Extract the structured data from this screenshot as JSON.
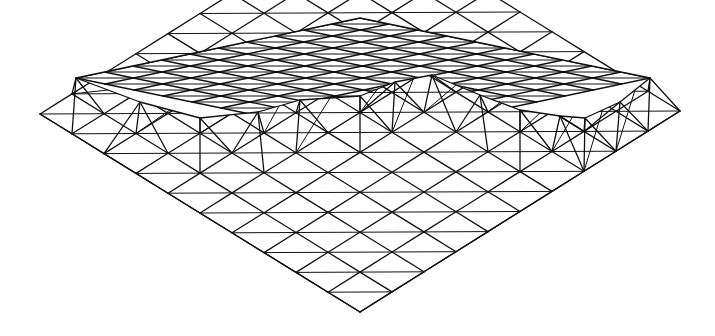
{
  "figure": {
    "title": "Space frame wireframe drawing",
    "stroke_color": "#111111",
    "background": "#ffffff"
  },
  "geometry": {
    "lower_layer": {
      "corners": {
        "left": [
          40,
          114
        ],
        "bottom": [
          360,
          312
        ],
        "right": [
          680,
          111
        ],
        "back": [
          360,
          -87
        ]
      },
      "divisions": 10
    },
    "upper_layer": {
      "corners": {
        "top": [
          360,
          18
        ],
        "left": [
          76,
          78
        ],
        "right": [
          650,
          78
        ],
        "front": [
          366,
          138
        ]
      },
      "divisions": 10,
      "visible_rows_from_back": 4
    },
    "recess_front_edge": [
      [
        76,
        78
      ],
      [
        140,
        102
      ],
      [
        200,
        118
      ],
      [
        258,
        112
      ],
      [
        300,
        100
      ],
      [
        360,
        96
      ],
      [
        395,
        82
      ],
      [
        432,
        75
      ],
      [
        480,
        95
      ],
      [
        520,
        110
      ],
      [
        560,
        116
      ],
      [
        585,
        118
      ],
      [
        620,
        102
      ],
      [
        650,
        78
      ]
    ]
  }
}
